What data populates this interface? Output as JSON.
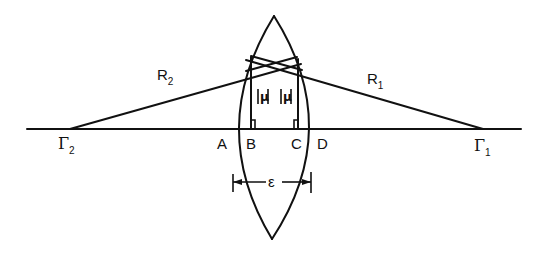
{
  "diagram": {
    "stroke_color": "#111111",
    "background": "#ffffff",
    "labels": {
      "R1": {
        "main": "R",
        "sub": "1"
      },
      "R2": {
        "main": "R",
        "sub": "2"
      },
      "Gamma1": {
        "main": "Γ",
        "sub": "1"
      },
      "Gamma2": {
        "main": "Γ",
        "sub": "2"
      },
      "A": "A",
      "B": "B",
      "C": "C",
      "D": "D",
      "mu_left": "|u|",
      "mu_right": "|u|",
      "epsilon": "ε"
    },
    "geometry": {
      "axis": {
        "x1": 27,
        "x2": 521,
        "y": 129
      },
      "gamma2_point": {
        "x": 70,
        "y": 129
      },
      "gamma1_point": {
        "x": 483,
        "y": 129
      },
      "lens_top": {
        "x": 274,
        "y": 16
      },
      "lens_bottom": {
        "x": 272,
        "y": 239
      },
      "A_x": 234,
      "B_x": 251,
      "C_x": 298,
      "D_x": 313,
      "epsilon_y": 182
    }
  }
}
